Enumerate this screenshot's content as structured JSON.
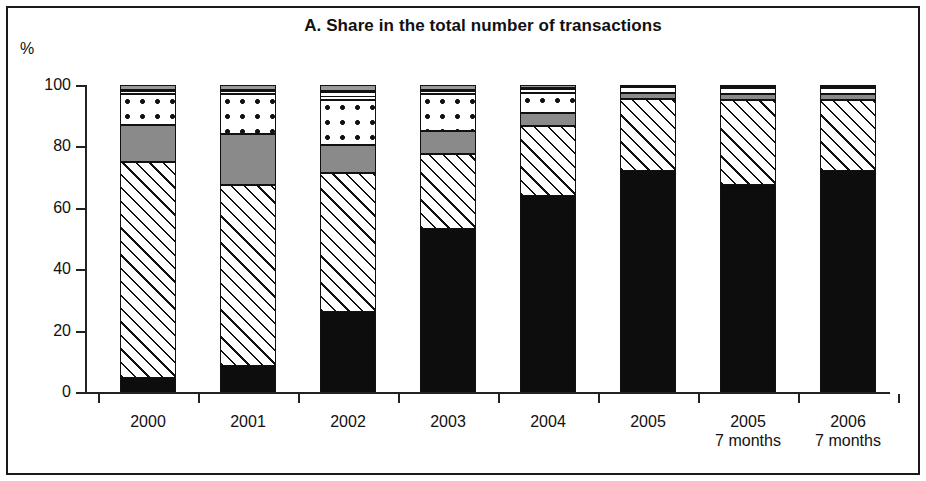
{
  "figure": {
    "title": "A. Share in the total number of transactions",
    "unit_label": "%"
  },
  "axes": {
    "y_ticks": [
      "0",
      "20",
      "40",
      "60",
      "80",
      "100"
    ],
    "x_labels": [
      {
        "line1": "2000",
        "line2": ""
      },
      {
        "line1": "2001",
        "line2": ""
      },
      {
        "line1": "2002",
        "line2": ""
      },
      {
        "line1": "2003",
        "line2": ""
      },
      {
        "line1": "2004",
        "line2": ""
      },
      {
        "line1": "2005",
        "line2": ""
      },
      {
        "line1": "2005",
        "line2": "7 months"
      },
      {
        "line1": "2006",
        "line2": "7 months"
      }
    ]
  },
  "chart_data": {
    "type": "bar",
    "title": "A. Share in the total number of transactions",
    "subtitle": "",
    "xlabel": "",
    "ylabel": "%",
    "ylim": [
      0,
      100
    ],
    "yticks": [
      0,
      20,
      40,
      60,
      80,
      100
    ],
    "grid": false,
    "legend": "none",
    "stacked": true,
    "stack_order": "bottom-to-top",
    "categories": [
      "2000",
      "2001",
      "2002",
      "2003",
      "2004",
      "2005",
      "2005 7 months",
      "2006 7 months"
    ],
    "series": [
      {
        "name": "black-solid",
        "pattern": "solid-black",
        "color": "#0d0d0d",
        "values": [
          4.5,
          8.5,
          26.0,
          53.0,
          64.0,
          72.0,
          67.5,
          72.0
        ]
      },
      {
        "name": "diagonal-hatch",
        "pattern": "diagonal-hatch",
        "color": "#ffffff",
        "values": [
          70.5,
          59.0,
          45.5,
          24.5,
          22.5,
          23.5,
          27.5,
          23.0
        ]
      },
      {
        "name": "solid-gray",
        "pattern": "solid-gray",
        "color": "#8a8a8a",
        "values": [
          12.0,
          16.5,
          9.0,
          7.5,
          4.5,
          2.0,
          2.0,
          2.0
        ]
      },
      {
        "name": "dotted",
        "pattern": "dots",
        "color": "#ffffff",
        "values": [
          10.0,
          13.0,
          14.5,
          12.0,
          6.5,
          2.0,
          2.0,
          2.0
        ]
      },
      {
        "name": "horizontal-lines",
        "pattern": "fine-lines",
        "color": "#ffffff",
        "values": [
          1.5,
          1.5,
          3.0,
          1.5,
          1.5,
          0.5,
          0.5,
          0.5
        ]
      },
      {
        "name": "gray-cap",
        "pattern": "solid-gray",
        "color": "#9a9a9a",
        "values": [
          1.5,
          1.5,
          2.0,
          1.5,
          1.0,
          0.0,
          0.5,
          0.5
        ]
      }
    ]
  },
  "colors": {
    "axis": "#222222",
    "text": "#111111",
    "frame": "#1a1a1a",
    "gray_segment": "#8a8a8a",
    "black_segment": "#0d0d0d",
    "background": "#ffffff"
  }
}
